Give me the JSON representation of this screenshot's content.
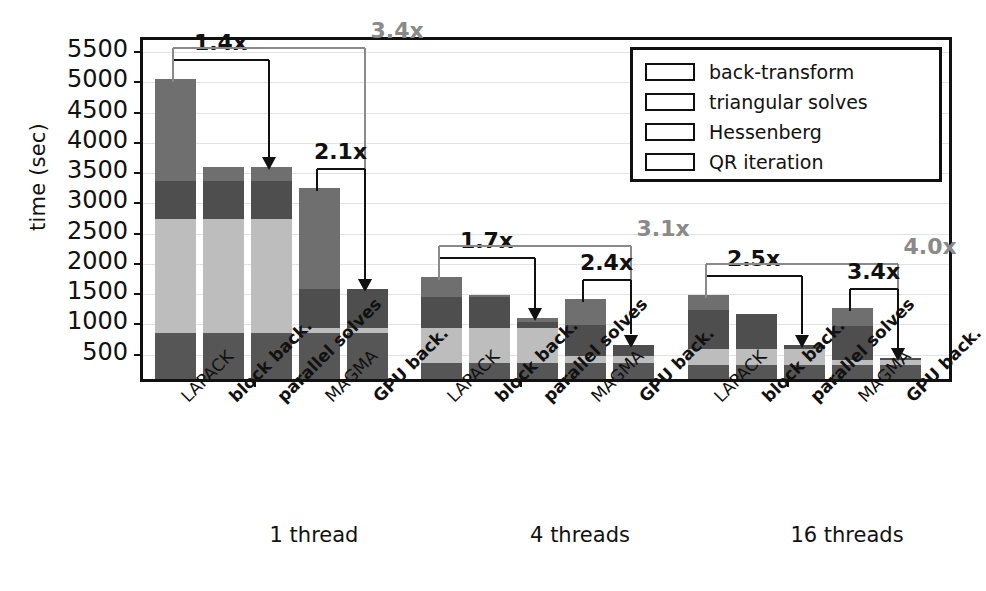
{
  "chart_data": {
    "type": "bar",
    "title": "",
    "xlabel": "",
    "ylabel": "time (sec)",
    "ylim": [
      0,
      5700
    ],
    "yticks": [
      500,
      1000,
      1500,
      2000,
      2500,
      3000,
      3500,
      4000,
      4500,
      5000,
      5500
    ],
    "grid": true,
    "stacked": true,
    "legend_position": "top-right",
    "legend": [
      "back-transform",
      "triangular solves",
      "Hessenberg",
      "QR iteration"
    ],
    "series_colors": {
      "back-transform": "#6f6f6f",
      "triangular solves": "#4e4e4e",
      "Hessenberg": "#bdbdbd",
      "QR iteration": "#565656"
    },
    "groups": [
      "1 thread",
      "4 threads",
      "16 threads"
    ],
    "categories": [
      "LAPACK",
      "block back.",
      "parallel solves",
      "MAGMA",
      "GPU back."
    ],
    "category_bold": [
      false,
      true,
      true,
      false,
      true
    ],
    "data": [
      {
        "group": "1 thread",
        "bars": [
          {
            "label": "LAPACK",
            "QR iteration": 760,
            "Hessenberg": 1890,
            "triangular solves": 620,
            "back-transform": 1690,
            "total": 4960
          },
          {
            "label": "block back.",
            "QR iteration": 760,
            "Hessenberg": 1890,
            "triangular solves": 620,
            "back-transform": 240,
            "total": 3510
          },
          {
            "label": "parallel solves",
            "QR iteration": 760,
            "Hessenberg": 1890,
            "triangular solves": 620,
            "back-transform": 240,
            "total": 3510
          },
          {
            "label": "MAGMA",
            "QR iteration": 760,
            "Hessenberg": 80,
            "triangular solves": 650,
            "back-transform": 1660,
            "total": 3150
          },
          {
            "label": "GPU back.",
            "QR iteration": 760,
            "Hessenberg": 80,
            "triangular solves": 650,
            "back-transform": 0,
            "total": 1490
          }
        ]
      },
      {
        "group": "4 threads",
        "bars": [
          {
            "label": "LAPACK",
            "QR iteration": 260,
            "Hessenberg": 580,
            "triangular solves": 520,
            "back-transform": 330,
            "total": 1690
          },
          {
            "label": "block back.",
            "QR iteration": 260,
            "Hessenberg": 580,
            "triangular solves": 520,
            "back-transform": 30,
            "total": 1390
          },
          {
            "label": "parallel solves",
            "QR iteration": 260,
            "Hessenberg": 580,
            "triangular solves": 110,
            "back-transform": 50,
            "total": 1000
          },
          {
            "label": "MAGMA",
            "QR iteration": 260,
            "Hessenberg": 120,
            "triangular solves": 520,
            "back-transform": 420,
            "total": 1320
          },
          {
            "label": "GPU back.",
            "QR iteration": 260,
            "Hessenberg": 120,
            "triangular solves": 190,
            "back-transform": 0,
            "total": 570
          }
        ]
      },
      {
        "group": "16 threads",
        "bars": [
          {
            "label": "LAPACK",
            "QR iteration": 230,
            "Hessenberg": 270,
            "triangular solves": 640,
            "back-transform": 240,
            "total": 1380
          },
          {
            "label": "block back.",
            "QR iteration": 230,
            "Hessenberg": 270,
            "triangular solves": 570,
            "back-transform": 0,
            "total": 1070
          },
          {
            "label": "parallel solves",
            "QR iteration": 230,
            "Hessenberg": 270,
            "triangular solves": 70,
            "back-transform": 0,
            "total": 570
          },
          {
            "label": "MAGMA",
            "QR iteration": 230,
            "Hessenberg": 90,
            "triangular solves": 550,
            "back-transform": 310,
            "total": 1180
          },
          {
            "label": "GPU back.",
            "QR iteration": 230,
            "Hessenberg": 90,
            "triangular solves": 30,
            "back-transform": 0,
            "total": 350
          }
        ]
      }
    ],
    "annotations": [
      {
        "text": "1.4x",
        "group": "1 thread",
        "from": "LAPACK",
        "to": "parallel solves",
        "color": "black"
      },
      {
        "text": "3.4x",
        "group": "1 thread",
        "from": "LAPACK",
        "to": "GPU back.",
        "color": "gray"
      },
      {
        "text": "2.1x",
        "group": "1 thread",
        "from": "MAGMA",
        "to": "GPU back.",
        "color": "black"
      },
      {
        "text": "1.7x",
        "group": "4 threads",
        "from": "LAPACK",
        "to": "parallel solves",
        "color": "black"
      },
      {
        "text": "3.1x",
        "group": "4 threads",
        "from": "LAPACK",
        "to": "GPU back.",
        "color": "gray"
      },
      {
        "text": "2.4x",
        "group": "4 threads",
        "from": "MAGMA",
        "to": "GPU back.",
        "color": "black"
      },
      {
        "text": "2.5x",
        "group": "16 threads",
        "from": "LAPACK",
        "to": "parallel solves",
        "color": "black"
      },
      {
        "text": "4.0x",
        "group": "16 threads",
        "from": "LAPACK",
        "to": "GPU back.",
        "color": "gray"
      },
      {
        "text": "3.4x",
        "group": "16 threads",
        "from": "MAGMA",
        "to": "GPU back.",
        "color": "black"
      }
    ]
  }
}
